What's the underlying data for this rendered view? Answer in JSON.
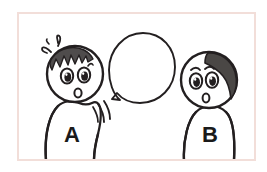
{
  "illustration": {
    "title": "Two cartoon characters with an empty speech bubble",
    "description": "Character A on the left is surprised and speaking; an empty speech balloon points from A toward the centre; character B stands on the right listening.",
    "background_color": "#ffffff",
    "frame": {
      "name": "panel-border",
      "stroke_color": "#f2ded9",
      "fill_color": "#ffffff",
      "stroke_width": 2,
      "x": 18,
      "y": 13,
      "width": 237,
      "height": 147
    },
    "ink_color": "#231f20",
    "hair_color": "#4f4c4c",
    "hair_color_b": "#4a4745",
    "characters": [
      {
        "id": "character-a",
        "label": "A",
        "label_color": "#1a1a1a",
        "position": "left",
        "expression": "surprised",
        "hair_style": "spiky-jagged-left",
        "eyes": 2,
        "mouth": "open-oval",
        "has_sweat_marks": true,
        "has_speed_lines": true
      },
      {
        "id": "character-b",
        "label": "B",
        "label_color": "#1a1a1a",
        "position": "right",
        "expression": "surprised",
        "hair_style": "swept-right",
        "eyes": 2,
        "eyebrows": 2,
        "mouth": "open-oval",
        "has_sweat_marks": false,
        "has_speed_lines": false
      }
    ],
    "speech_bubble": {
      "name": "speech-bubble",
      "text": "",
      "shape": "round",
      "tail_direction": "down-left",
      "points_to": "character-a",
      "stroke_color": "#231f20",
      "fill_color": "#ffffff"
    },
    "effects": {
      "sweat_marks_label": "surprise marks",
      "sweat_marks_count": 3,
      "speed_lines_label": "motion lines",
      "speed_lines_count": 3
    }
  }
}
